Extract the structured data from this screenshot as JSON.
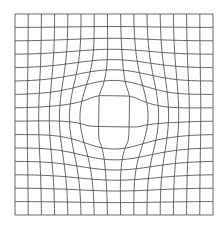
{
  "figure": {
    "background": "#ffffff",
    "line_color": "#555555",
    "line_width": 0.9,
    "bounds": {
      "left": 15,
      "top": 14,
      "right": 213,
      "bottom": 215
    },
    "rows": 15,
    "cols": 15,
    "warp": {
      "center": [
        114,
        117
      ],
      "strength": 16,
      "radius": 55,
      "twist": 0.12
    }
  }
}
